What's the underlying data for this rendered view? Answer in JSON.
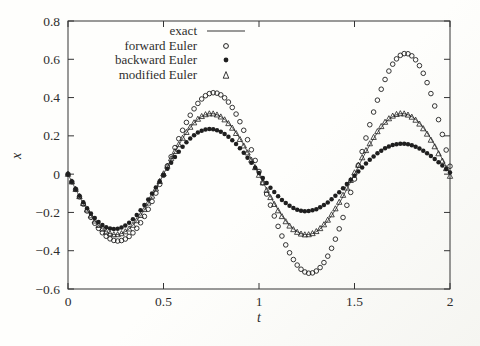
{
  "chart_data": {
    "type": "line",
    "title": "",
    "xlabel": "t",
    "ylabel": "x",
    "xlim": [
      0,
      2
    ],
    "ylim": [
      -0.6,
      0.8
    ],
    "xticks": [
      0,
      0.5,
      1,
      1.5,
      2
    ],
    "xtick_labels": [
      "0",
      "0.5",
      "1",
      "1.5",
      "2"
    ],
    "yticks": [
      -0.6,
      -0.4,
      -0.2,
      0,
      0.2,
      0.4,
      0.6,
      0.8
    ],
    "ytick_labels": [
      "−0.6",
      "−0.4",
      "−0.2",
      "0",
      "0.2",
      "0.4",
      "0.6",
      "0.8"
    ],
    "grid": false,
    "legend_position": "top-center-inside",
    "legend_frame": false,
    "ink_color": "#343434",
    "marker_color": "#1f1f1f",
    "series": [
      {
        "name": "exact",
        "style": "line",
        "marker": "none",
        "model": {
          "kind": "sine",
          "amplitude": 0.316,
          "omega": 6.283185,
          "sign": -1
        },
        "key_points": [
          [
            0,
            0
          ],
          [
            0.25,
            -0.316
          ],
          [
            0.5,
            0
          ],
          [
            0.75,
            0.316
          ],
          [
            1,
            0
          ],
          [
            1.25,
            -0.316
          ],
          [
            1.5,
            0
          ],
          [
            1.75,
            0.316
          ],
          [
            2,
            0
          ]
        ]
      },
      {
        "name": "forward Euler",
        "style": "markers",
        "marker": "open-circle",
        "model": {
          "kind": "discrete",
          "h": 0.02,
          "amplitude0": 0.316,
          "growth_per_step": 1.0078647,
          "phase_per_step": 0.1250666,
          "sign": -1
        },
        "key_points": [
          [
            0.26,
            -0.35
          ],
          [
            0.76,
            0.43
          ],
          [
            1.26,
            -0.52
          ],
          [
            1.76,
            0.63
          ],
          [
            2,
            0.04
          ]
        ]
      },
      {
        "name": "backward Euler",
        "style": "markers",
        "marker": "filled-circle",
        "model": {
          "kind": "discrete",
          "h": 0.02,
          "amplitude0": 0.316,
          "growth_per_step": 0.9921967,
          "phase_per_step": 0.1250666,
          "sign": -1
        },
        "key_points": [
          [
            0.24,
            -0.29
          ],
          [
            0.74,
            0.24
          ],
          [
            1.24,
            -0.2
          ],
          [
            1.74,
            0.16
          ],
          [
            2,
            0.01
          ]
        ]
      },
      {
        "name": "modified Euler",
        "style": "markers",
        "marker": "open-triangle",
        "model": {
          "kind": "discrete",
          "h": 0.02,
          "amplitude0": 0.316,
          "growth_per_step": 1.0000306,
          "phase_per_step": 0.1259868,
          "sign": -1
        },
        "key_points": [
          [
            0.25,
            -0.32
          ],
          [
            0.75,
            0.32
          ],
          [
            1.25,
            -0.32
          ],
          [
            1.75,
            0.32
          ],
          [
            2,
            -0.01
          ]
        ]
      }
    ]
  }
}
